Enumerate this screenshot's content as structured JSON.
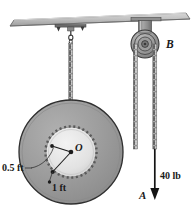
{
  "figure": {
    "background_color": "#ffffff",
    "labels": {
      "pulley_b": "B",
      "center_o": "O",
      "point_a": "A",
      "force": "40 lb",
      "inner_radius": "0.5 ft",
      "outer_radius": "1 ft"
    },
    "colors": {
      "wheel_fill": "#9a9a9a",
      "hub_fill": "#e2e2e2",
      "ceiling_fill": "#b8b8b8",
      "bracket_fill": "#8e8e8e",
      "chain_color": "#6b6b6b",
      "outline": "#2b2b2b",
      "text": "#1a1a1a"
    },
    "geometry": {
      "wheel_center_x": 71,
      "wheel_center_y": 152,
      "wheel_outer_radius": 52,
      "wheel_hub_radius": 25,
      "pulley_center_x": 145,
      "pulley_center_y": 44,
      "pulley_radius": 14
    },
    "elements": {
      "ceiling": "ceiling-beam",
      "hook": "ceiling-hook",
      "bracket": "pulley-bracket",
      "left_chain": "left-chain",
      "mid_chain": "middle-chain",
      "right_chain": "right-chain",
      "force_arrow": "force-arrow-down"
    }
  }
}
